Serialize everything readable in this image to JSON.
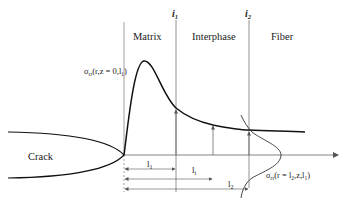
{
  "diagram": {
    "regions": {
      "matrix": "Matrix",
      "interphase": "Interphase",
      "fiber": "Fiber",
      "crack": "Crack"
    },
    "interfaces": {
      "i1": "i",
      "i1_sub": "1",
      "i2": "i",
      "i2_sub": "2"
    },
    "stress_labels": {
      "peak_prefix": "σ",
      "peak_sub": "rr",
      "peak_body": "(r,z = 0,l",
      "peak_sub2": "1",
      "peak_close": ")",
      "fiber_prefix": "σ",
      "fiber_sub": "rr",
      "fiber_body": "(r = l",
      "fiber_sub2": "2",
      "fiber_mid": ",z,l",
      "fiber_sub3": "1",
      "fiber_close": ")"
    },
    "dimensions": {
      "l1": "l",
      "l1_sub": "1",
      "li": "l",
      "li_sub": "i",
      "l2": "l",
      "l2_sub": "2"
    },
    "colors": {
      "curve": "#111111",
      "guide": "#777777",
      "text": "#222222"
    }
  }
}
